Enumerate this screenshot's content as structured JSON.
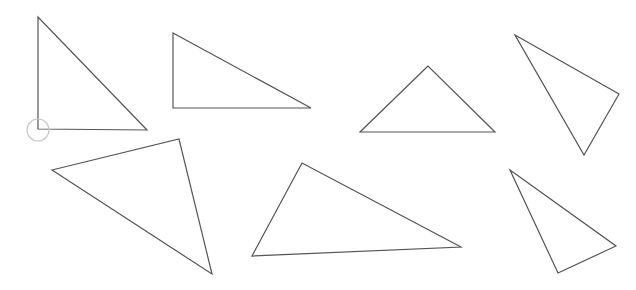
{
  "canvas": {
    "width": 636,
    "height": 290,
    "background": "#ffffff",
    "stroke_color": "#555555",
    "marker_color": "#c8c8c8"
  },
  "triangles": [
    {
      "id": "triangle-1",
      "points": [
        [
          38,
          17
        ],
        [
          38,
          129
        ],
        [
          147,
          130
        ]
      ]
    },
    {
      "id": "triangle-2",
      "points": [
        [
          173,
          33
        ],
        [
          173,
          108
        ],
        [
          311,
          108
        ]
      ]
    },
    {
      "id": "triangle-3",
      "points": [
        [
          428,
          66
        ],
        [
          360,
          132
        ],
        [
          495,
          132
        ]
      ]
    },
    {
      "id": "triangle-4",
      "points": [
        [
          515,
          35
        ],
        [
          619,
          94
        ],
        [
          584,
          155
        ]
      ]
    },
    {
      "id": "triangle-5",
      "points": [
        [
          52,
          170
        ],
        [
          179,
          139
        ],
        [
          212,
          274
        ]
      ]
    },
    {
      "id": "triangle-6",
      "points": [
        [
          302,
          163
        ],
        [
          252,
          256
        ],
        [
          461,
          247
        ]
      ]
    },
    {
      "id": "triangle-7",
      "points": [
        [
          510,
          170
        ],
        [
          616,
          246
        ],
        [
          558,
          273
        ]
      ]
    }
  ],
  "markers": [
    {
      "id": "vertex-circle-marker",
      "cx": 38,
      "cy": 130,
      "r": 11
    }
  ]
}
